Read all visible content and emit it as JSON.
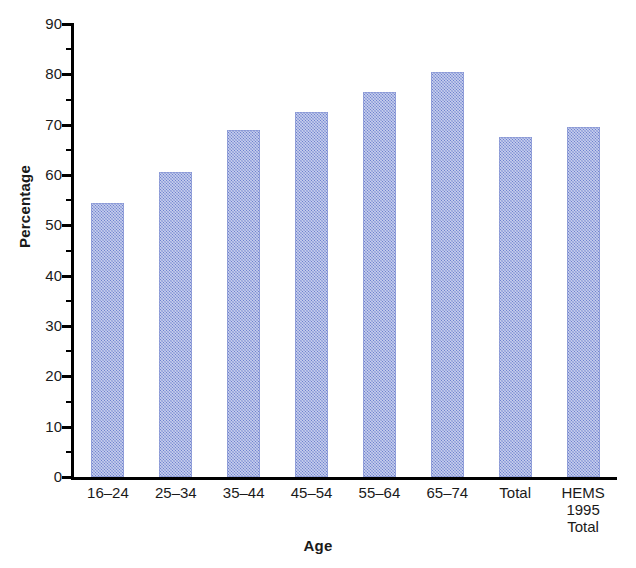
{
  "chart_data": {
    "type": "bar",
    "title": "",
    "xlabel": "Age",
    "ylabel": "Percentage",
    "ylim": [
      0,
      90
    ],
    "ytick_step": 10,
    "grid": false,
    "legend": "none",
    "bar_color": "#6d81cf",
    "axis_color": "#000000",
    "categories": [
      "16–24",
      "25–34",
      "35–44",
      "45–54",
      "55–64",
      "65–74",
      "Total",
      "HEMS\n1995\nTotal"
    ],
    "category_lines": [
      [
        "16–24"
      ],
      [
        "25–34"
      ],
      [
        "35–44"
      ],
      [
        "45–54"
      ],
      [
        "55–64"
      ],
      [
        "65–74"
      ],
      [
        "Total"
      ],
      [
        "HEMS",
        "1995",
        "Total"
      ]
    ],
    "values": [
      54.5,
      60.5,
      69,
      72.5,
      76.5,
      80.5,
      67.5,
      69.5
    ],
    "ytick_labels": [
      "90",
      "80",
      "70",
      "60",
      "50",
      "40",
      "30",
      "20",
      "10",
      "0"
    ],
    "ytick_values": [
      90,
      80,
      70,
      60,
      50,
      40,
      30,
      20,
      10,
      0
    ]
  }
}
